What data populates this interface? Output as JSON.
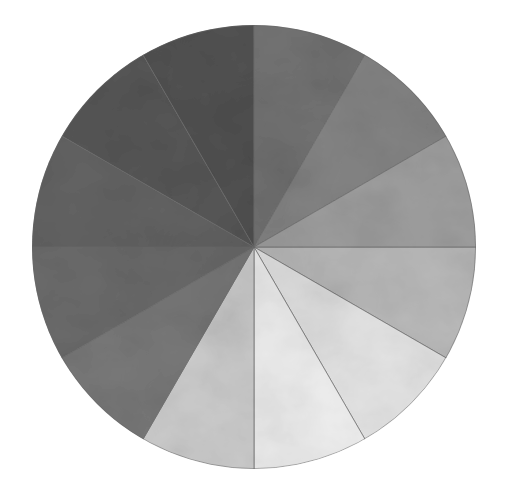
{
  "page": {
    "background_color": "#ffffff",
    "width": 507,
    "height": 495
  },
  "figure": {
    "name": "grayscale-value-wheel",
    "medium_note": "hand-painted wash on paper, scanned",
    "center_x": 254,
    "center_y": 247,
    "radius": 222,
    "segment_count": 12,
    "segment_span_degrees": 30,
    "edge_stroke_color": "#6e6e6e",
    "paper_color": "#ffffff"
  },
  "chart_data": {
    "type": "pie",
    "xlabel": "",
    "ylabel": "",
    "legend_position": "none",
    "grid": false,
    "note": "Twelve equal 30-degree wedges of a value scale, ordered light to dark clockwise from the lower-right; values are sampled mean gray levels (0 = black, 255 = white).",
    "categories": [
      "Wedge 1",
      "Wedge 2",
      "Wedge 3",
      "Wedge 4",
      "Wedge 5",
      "Wedge 6",
      "Wedge 7",
      "Wedge 8",
      "Wedge 9",
      "Wedge 10",
      "Wedge 11",
      "Wedge 12"
    ],
    "values": [
      30,
      30,
      30,
      30,
      30,
      30,
      30,
      30,
      30,
      30,
      30,
      30
    ],
    "ylim": [
      0,
      360
    ],
    "slices": [
      {
        "index": 1,
        "label": "Wedge 1",
        "start_deg": 0,
        "end_deg": 30,
        "span_deg": 30,
        "gray_level": 188,
        "color": "#bcbcbc",
        "value_step": "Value 6"
      },
      {
        "index": 2,
        "label": "Wedge 2",
        "start_deg": 30,
        "end_deg": 60,
        "span_deg": 30,
        "gray_level": 231,
        "color": "#e7e7e7",
        "value_step": "Value 9"
      },
      {
        "index": 3,
        "label": "Wedge 3",
        "start_deg": 60,
        "end_deg": 90,
        "span_deg": 30,
        "gray_level": 243,
        "color": "#f3f3f3",
        "value_step": "Value 10"
      },
      {
        "index": 4,
        "label": "Wedge 4",
        "start_deg": 90,
        "end_deg": 120,
        "span_deg": 30,
        "gray_level": 209,
        "color": "#d1d1d1",
        "value_step": "Value 8"
      },
      {
        "index": 5,
        "label": "Wedge 5",
        "start_deg": 120,
        "end_deg": 150,
        "span_deg": 30,
        "gray_level": 122,
        "color": "#7a7a7a",
        "value_step": "Value 4"
      },
      {
        "index": 6,
        "label": "Wedge 6",
        "start_deg": 150,
        "end_deg": 180,
        "span_deg": 30,
        "gray_level": 108,
        "color": "#6c6c6c",
        "value_step": "Value 3"
      },
      {
        "index": 7,
        "label": "Wedge 7",
        "start_deg": 180,
        "end_deg": 210,
        "span_deg": 30,
        "gray_level": 100,
        "color": "#646464",
        "value_step": "Value 3"
      },
      {
        "index": 8,
        "label": "Wedge 8",
        "start_deg": 210,
        "end_deg": 240,
        "span_deg": 30,
        "gray_level": 88,
        "color": "#585858",
        "value_step": "Value 2"
      },
      {
        "index": 9,
        "label": "Wedge 9",
        "start_deg": 240,
        "end_deg": 270,
        "span_deg": 30,
        "gray_level": 82,
        "color": "#525252",
        "value_step": "Value 2"
      },
      {
        "index": 10,
        "label": "Wedge 10",
        "start_deg": 270,
        "end_deg": 300,
        "span_deg": 30,
        "gray_level": 116,
        "color": "#747474",
        "value_step": "Value 4"
      },
      {
        "index": 11,
        "label": "Wedge 11",
        "start_deg": 300,
        "end_deg": 330,
        "span_deg": 30,
        "gray_level": 134,
        "color": "#868686",
        "value_step": "Value 5"
      },
      {
        "index": 12,
        "label": "Wedge 12",
        "start_deg": 330,
        "end_deg": 360,
        "span_deg": 30,
        "gray_level": 161,
        "color": "#a1a1a1",
        "value_step": "Value 6"
      }
    ]
  }
}
